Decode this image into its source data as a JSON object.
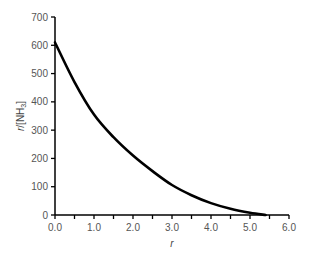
{
  "chart_data": {
    "type": "line",
    "title": "",
    "xlabel": "r",
    "ylabel": "r/[NH3]",
    "ylabel_parts": {
      "italic": "r",
      "plain": "/[NH",
      "sub": "3",
      "close": "]"
    },
    "xlim": [
      0,
      6.0
    ],
    "ylim": [
      0,
      700
    ],
    "x_ticks": [
      "0.0",
      "1.0",
      "2.0",
      "3.0",
      "4.0",
      "5.0",
      "6.0"
    ],
    "x_minor_tick_step": 0.5,
    "y_ticks": [
      "0",
      "100",
      "200",
      "300",
      "400",
      "500",
      "600",
      "700"
    ],
    "grid": false,
    "legend": null,
    "series": [
      {
        "name": "r/[NH3] vs r",
        "color": "#000000",
        "x": [
          0.0,
          0.5,
          1.0,
          1.5,
          2.0,
          2.5,
          3.0,
          3.5,
          4.0,
          4.5,
          5.0,
          5.4
        ],
        "values": [
          610,
          470,
          355,
          275,
          210,
          155,
          106,
          70,
          42,
          22,
          8,
          0
        ]
      }
    ]
  }
}
